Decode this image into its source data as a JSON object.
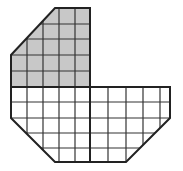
{
  "figure": {
    "colors": {
      "shaded_fill": "#c8c8c8",
      "unshaded_fill": "#ffffff",
      "grid_line": "#333333",
      "outline": "#222222"
    },
    "shaded_region": {
      "label": "shaded",
      "grid_columns": 5,
      "grid_rows": 5
    },
    "unshaded_region": {
      "label": "unshaded",
      "grid_columns": 10,
      "grid_rows": 5
    }
  }
}
